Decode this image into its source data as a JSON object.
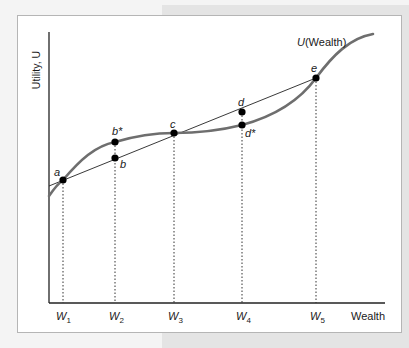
{
  "diagram": {
    "title": "",
    "y_axis_label": "Utility, U",
    "x_axis_label": "Wealth",
    "curve_label": {
      "italic": "U",
      "rest": "(Wealth)"
    },
    "points": [
      {
        "id": "a",
        "label": "a"
      },
      {
        "id": "b*",
        "label": "b*"
      },
      {
        "id": "b",
        "label": "b"
      },
      {
        "id": "c",
        "label": "c"
      },
      {
        "id": "d",
        "label": "d"
      },
      {
        "id": "d*",
        "label": "d*"
      },
      {
        "id": "e",
        "label": "e"
      }
    ],
    "x_ticks": [
      {
        "base": "W",
        "sub": "1"
      },
      {
        "base": "W",
        "sub": "2"
      },
      {
        "base": "W",
        "sub": "3"
      },
      {
        "base": "W",
        "sub": "4"
      },
      {
        "base": "W",
        "sub": "5"
      }
    ],
    "colors": {
      "curve": "#6e6e6e",
      "chord": "#222222",
      "point": "#000000",
      "axis": "#222222",
      "frame_border": "#b5b5b5",
      "background_panel": "#e4e4e4"
    }
  }
}
